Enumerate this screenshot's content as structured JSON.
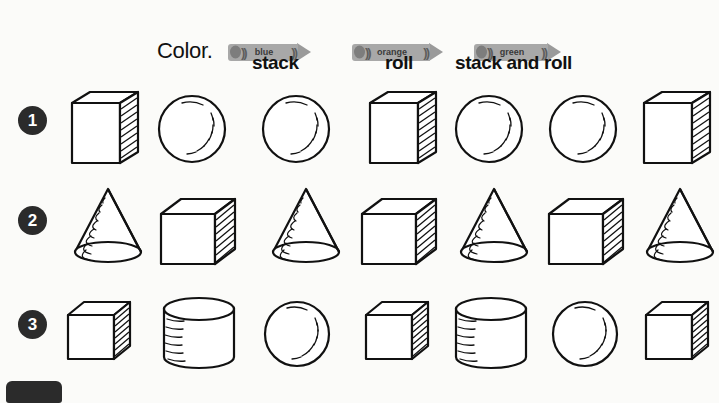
{
  "worksheet": {
    "instruction": "Color.",
    "crayons": [
      {
        "label": "blue",
        "swatch": "#a8a8a8"
      },
      {
        "label": "orange",
        "swatch": "#a8a8a8"
      },
      {
        "label": "green",
        "swatch": "#a8a8a8"
      }
    ],
    "column_headings": [
      "stack",
      "roll",
      "stack and roll"
    ],
    "rows": [
      {
        "number": "1",
        "shapes": [
          "rectangular-prism",
          "sphere",
          "sphere",
          "rectangular-prism",
          "sphere",
          "sphere",
          "rectangular-prism"
        ]
      },
      {
        "number": "2",
        "shapes": [
          "cone",
          "cube",
          "cone",
          "cube",
          "cone",
          "cube",
          "cone"
        ]
      },
      {
        "number": "3",
        "shapes": [
          "cube",
          "cylinder",
          "sphere",
          "cube",
          "cylinder",
          "sphere",
          "cube"
        ]
      }
    ]
  }
}
